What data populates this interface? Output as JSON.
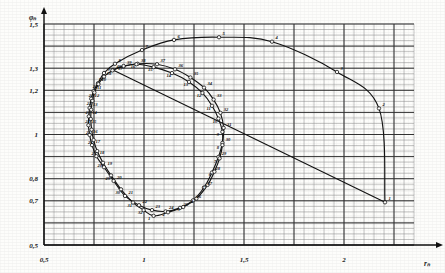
{
  "figure": {
    "title": "",
    "bg_color": "#fdfdfb",
    "ink_color": "#141414",
    "grid_minor_color": "#8d8d8d",
    "grid_major_color": "#2c2c2c"
  },
  "axes": {
    "x": {
      "label": "rₙ",
      "label_plain": "rn",
      "min": 0.5,
      "max": 2.35,
      "ticks": [
        0.5,
        1.0,
        1.5,
        2.0
      ],
      "tick_labels": [
        "0,5",
        "1",
        "1,5",
        "2"
      ],
      "minor_step": 0.05,
      "major_step": 0.25
    },
    "y": {
      "label": "φₙ",
      "label_plain": "fn",
      "min": 0.5,
      "max": 1.5,
      "ticks": [
        0.5,
        0.7,
        0.8,
        1.0,
        1.2,
        1.3,
        1.5
      ],
      "tick_labels": [
        "0,5",
        "0,7",
        "0,8",
        "1",
        "1,2",
        "1,3",
        "1,5"
      ],
      "minor_step": 0.025,
      "major_step": 0.1
    }
  },
  "chart_data": {
    "type": "line",
    "title": "",
    "xlabel": "rₙ",
    "ylabel": "φₙ",
    "xlim": [
      0.5,
      2.35
    ],
    "ylim": [
      0.5,
      1.5
    ],
    "grid": true,
    "legend": "none",
    "series": [
      {
        "name": "outer-loop",
        "marker": "open-circle",
        "points": [
          {
            "label": "1",
            "x": 2.205,
            "y": 0.693
          },
          {
            "label": "2",
            "x": 2.175,
            "y": 1.118
          },
          {
            "label": "3",
            "x": 1.965,
            "y": 1.283
          },
          {
            "label": "4",
            "x": 1.64,
            "y": 1.42
          },
          {
            "label": "5",
            "x": 1.375,
            "y": 1.44
          },
          {
            "label": "6",
            "x": 1.15,
            "y": 1.428
          },
          {
            "label": "7",
            "x": 0.99,
            "y": 1.382
          },
          {
            "label": "8",
            "x": 0.855,
            "y": 1.32
          },
          {
            "label": "9",
            "x": 0.8,
            "y": 1.278
          },
          {
            "label": "10",
            "x": 0.77,
            "y": 1.232
          },
          {
            "label": "11",
            "x": 0.748,
            "y": 1.196
          },
          {
            "label": "12",
            "x": 0.736,
            "y": 1.162
          },
          {
            "label": "13",
            "x": 0.728,
            "y": 1.12
          },
          {
            "label": "14",
            "x": 0.724,
            "y": 1.082
          },
          {
            "label": "15",
            "x": 0.722,
            "y": 1.042
          },
          {
            "label": "16",
            "x": 0.728,
            "y": 0.998
          },
          {
            "label": "17",
            "x": 0.74,
            "y": 0.952
          },
          {
            "label": "18",
            "x": 0.762,
            "y": 0.902
          },
          {
            "label": "19",
            "x": 0.8,
            "y": 0.852
          },
          {
            "label": "20",
            "x": 0.848,
            "y": 0.79
          },
          {
            "label": "21",
            "x": 0.905,
            "y": 0.722
          },
          {
            "label": "22",
            "x": 0.975,
            "y": 0.68
          },
          {
            "label": "23",
            "x": 1.04,
            "y": 0.658
          },
          {
            "label": "24",
            "x": 1.108,
            "y": 0.652
          },
          {
            "label": "25",
            "x": 1.18,
            "y": 0.668
          },
          {
            "label": "26",
            "x": 1.245,
            "y": 0.702
          },
          {
            "label": "27",
            "x": 1.3,
            "y": 0.76
          },
          {
            "label": "28",
            "x": 1.34,
            "y": 0.828
          },
          {
            "label": "29",
            "x": 1.372,
            "y": 0.898
          },
          {
            "label": "30",
            "x": 1.392,
            "y": 0.962
          },
          {
            "label": "31",
            "x": 1.398,
            "y": 1.03
          },
          {
            "label": "32",
            "x": 1.382,
            "y": 1.098
          },
          {
            "label": "33",
            "x": 1.348,
            "y": 1.158
          },
          {
            "label": "34",
            "x": 1.3,
            "y": 1.212
          },
          {
            "label": "35",
            "x": 1.232,
            "y": 1.258
          },
          {
            "label": "36",
            "x": 1.155,
            "y": 1.295
          },
          {
            "label": "37",
            "x": 1.065,
            "y": 1.318
          },
          {
            "label": "38",
            "x": 0.968,
            "y": 1.32
          },
          {
            "label": "39",
            "x": 0.898,
            "y": 1.308
          },
          {
            "label": "40",
            "x": 0.845,
            "y": 1.292
          }
        ]
      },
      {
        "name": "inner-loop",
        "marker": "open-circle",
        "points": [
          {
            "label": "1",
            "x": 1.048,
            "y": 0.632
          },
          {
            "label": "2",
            "x": 1.12,
            "y": 0.648
          },
          {
            "label": "3",
            "x": 1.196,
            "y": 0.672
          },
          {
            "label": "4",
            "x": 1.262,
            "y": 0.71
          },
          {
            "label": "5",
            "x": 1.318,
            "y": 0.772
          },
          {
            "label": "6",
            "x": 1.352,
            "y": 0.832
          },
          {
            "label": "7",
            "x": 1.378,
            "y": 0.892
          },
          {
            "label": "8",
            "x": 1.392,
            "y": 0.952
          },
          {
            "label": "9",
            "x": 1.392,
            "y": 1.012
          },
          {
            "label": "10",
            "x": 1.372,
            "y": 1.072
          },
          {
            "label": "11",
            "x": 1.34,
            "y": 1.13
          },
          {
            "label": "12",
            "x": 1.292,
            "y": 1.188
          },
          {
            "label": "13",
            "x": 1.225,
            "y": 1.238
          },
          {
            "label": "14",
            "x": 1.14,
            "y": 1.278
          },
          {
            "label": "15",
            "x": 1.048,
            "y": 1.305
          },
          {
            "label": "16",
            "x": 0.962,
            "y": 1.318
          },
          {
            "label": "17",
            "x": 0.898,
            "y": 1.31
          },
          {
            "label": "18",
            "x": 0.842,
            "y": 1.29
          },
          {
            "label": "19",
            "x": 0.8,
            "y": 1.262
          },
          {
            "label": "20",
            "x": 0.772,
            "y": 1.228
          },
          {
            "label": "21",
            "x": 0.752,
            "y": 1.19
          },
          {
            "label": "22",
            "x": 0.742,
            "y": 1.152
          },
          {
            "label": "23",
            "x": 0.736,
            "y": 1.112
          },
          {
            "label": "24",
            "x": 0.734,
            "y": 1.07
          },
          {
            "label": "25",
            "x": 0.738,
            "y": 1.022
          },
          {
            "label": "26",
            "x": 0.748,
            "y": 0.975
          },
          {
            "label": "27",
            "x": 0.766,
            "y": 0.925
          },
          {
            "label": "28",
            "x": 0.795,
            "y": 0.872
          },
          {
            "label": "29",
            "x": 0.835,
            "y": 0.815
          },
          {
            "label": "30",
            "x": 0.885,
            "y": 0.752
          },
          {
            "label": "31",
            "x": 0.945,
            "y": 0.692
          },
          {
            "label": "32",
            "x": 0.998,
            "y": 0.658
          }
        ]
      }
    ],
    "annotations": []
  },
  "point_markers": {
    "outer_label_positions": "upper-right of each node",
    "inner_label_positions": "lower-left of each node"
  }
}
